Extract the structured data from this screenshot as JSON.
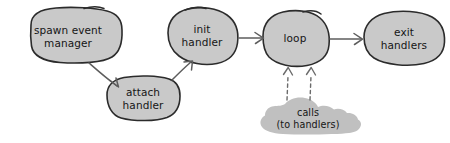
{
  "diagram": {
    "type": "flowchart",
    "background_color": "#ffffff",
    "node_fill_color": "#c9c9c9",
    "node_stroke_color": "#2b2b2b",
    "cloud_fill_color": "#c0c0c0",
    "edge_color": "#5d5d5d",
    "text_color": "#151515",
    "style": "hand-drawn sketch",
    "nodes": [
      {
        "id": "spawn-event-manager",
        "label": "spawn event\nmanager",
        "shape": "blob",
        "cx": 68,
        "cy": 36
      },
      {
        "id": "attach-handler",
        "label": "attach\nhandler",
        "shape": "blob",
        "cx": 142,
        "cy": 98
      },
      {
        "id": "init-handler",
        "label": "init\nhandler",
        "shape": "blob",
        "cx": 201,
        "cy": 35
      },
      {
        "id": "loop",
        "label": "loop",
        "shape": "blob",
        "cx": 293,
        "cy": 38
      },
      {
        "id": "exit-handlers",
        "label": "exit\nhandlers",
        "shape": "blob",
        "cx": 402,
        "cy": 38
      },
      {
        "id": "calls-to-handlers",
        "label": "calls\n(to handlers)",
        "shape": "cloud",
        "cx": 306,
        "cy": 119
      }
    ],
    "edges": [
      {
        "id": "spawn-to-attach",
        "from": "spawn-event-manager",
        "to": "attach-handler",
        "style": "solid",
        "arrow": "end"
      },
      {
        "id": "attach-to-init",
        "from": "attach-handler",
        "to": "init-handler",
        "style": "solid",
        "arrow": "end"
      },
      {
        "id": "init-to-loop",
        "from": "init-handler",
        "to": "loop",
        "style": "solid",
        "arrow": "end"
      },
      {
        "id": "loop-to-exit",
        "from": "loop",
        "to": "exit-handlers",
        "style": "solid",
        "arrow": "end"
      },
      {
        "id": "calls-to-loop-left",
        "from": "calls-to-handlers",
        "to": "loop",
        "style": "dashed",
        "arrow": "end"
      },
      {
        "id": "calls-to-loop-right",
        "from": "calls-to-handlers",
        "to": "loop",
        "style": "dashed",
        "arrow": "end"
      }
    ]
  }
}
